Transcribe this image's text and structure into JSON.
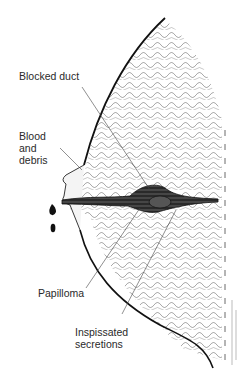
{
  "figure": {
    "labels": [
      {
        "id": "blocked-duct",
        "text": "Blocked duct"
      },
      {
        "id": "blood-debris",
        "text": "Blood\nand\ndebris"
      },
      {
        "id": "papilloma",
        "text": "Papilloma"
      },
      {
        "id": "inspissated",
        "text": "Inspissated\nsecretions"
      }
    ],
    "colors": {
      "ink": "#1a1a1a",
      "label_text": "#2a2a2a",
      "background": "#ffffff"
    }
  }
}
